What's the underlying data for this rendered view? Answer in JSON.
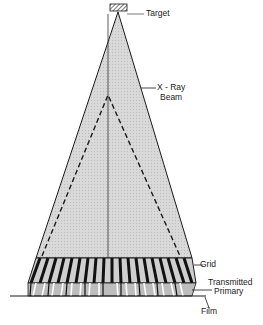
{
  "diagram": {
    "labels": {
      "target": "Target",
      "beam_line1": "X - Ray",
      "beam_line2": "Beam",
      "grid": "Grid",
      "transmitted_line1": "Transmitted",
      "transmitted_line2": "Primary",
      "film": "Film"
    },
    "colors": {
      "beam_fill": "#d6d6d6",
      "outline": "#1a1a1a",
      "grid_strip": "#111111",
      "interspace": "#c8c8c8",
      "background": "#ffffff"
    }
  }
}
